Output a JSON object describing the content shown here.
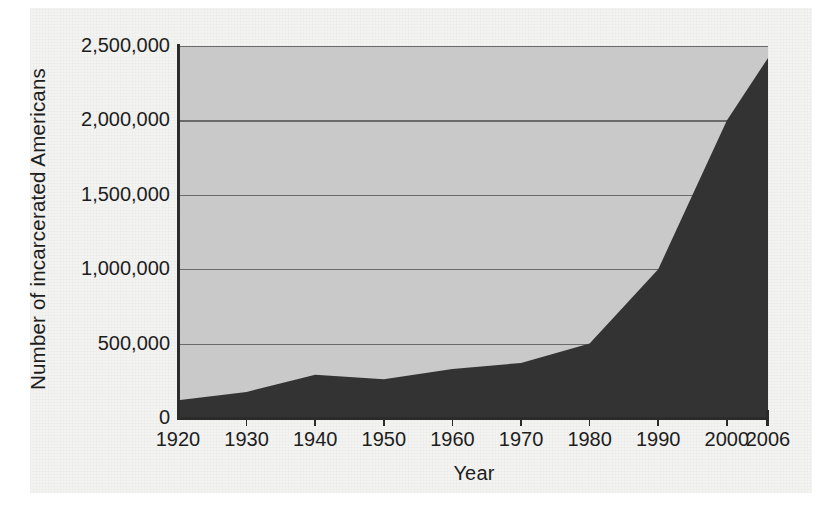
{
  "figure": {
    "kind": "scanned-book-figure",
    "background_color": "#f3f3f1",
    "page_color": "#ffffff"
  },
  "chart_data": {
    "type": "area",
    "title": "",
    "xlabel": "Year",
    "ylabel": "Number of incarcerated Americans",
    "x": [
      1920,
      1930,
      1940,
      1950,
      1960,
      1970,
      1980,
      1990,
      2000,
      2006
    ],
    "categories": [
      "1920",
      "1930",
      "1940",
      "1950",
      "1960",
      "1970",
      "1980",
      "1990",
      "2000",
      "2006"
    ],
    "values": [
      120000,
      175000,
      290000,
      260000,
      330000,
      370000,
      500000,
      1000000,
      2000000,
      2420000
    ],
    "series": [
      {
        "name": "Number of incarcerated Americans",
        "values": [
          120000,
          175000,
          290000,
          260000,
          330000,
          370000,
          500000,
          1000000,
          2000000,
          2420000
        ]
      }
    ],
    "xlim": [
      1920,
      2006
    ],
    "ylim": [
      0,
      2500000
    ],
    "ytick_values": [
      0,
      500000,
      1000000,
      1500000,
      2000000,
      2500000
    ],
    "ytick_labels": [
      "0",
      "500,000",
      "1,000,000",
      "1,500,000",
      "2,000,000",
      "2,500,000"
    ],
    "xtick_labels": [
      "1920",
      "1930",
      "1940",
      "1950",
      "1960",
      "1970",
      "1980",
      "1990",
      "2000",
      "2006"
    ],
    "grid": "horizontal",
    "legend": "none",
    "area_color": "#333333",
    "plot_background_color": "#c9c9c9",
    "gridline_color": "#6a6a6a",
    "axis_color": "#2b2b2b"
  }
}
